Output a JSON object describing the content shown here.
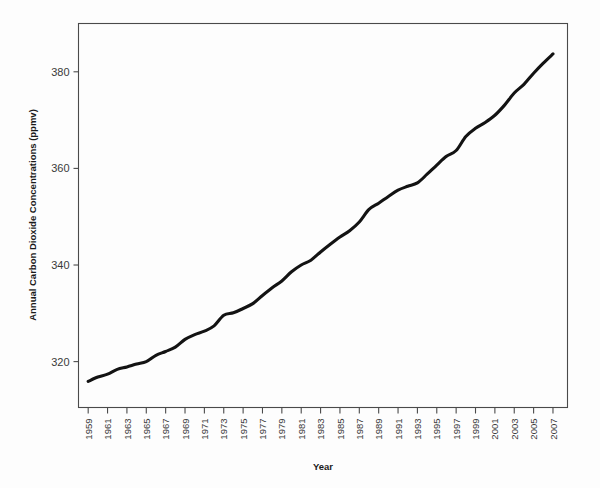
{
  "chart_data": {
    "type": "line",
    "title": "",
    "xlabel": "Year",
    "ylabel": "Annual Carbon Dioxide Concentrations (ppmv)",
    "xlim": [
      1958,
      2008.5
    ],
    "ylim": [
      310.5,
      390.0
    ],
    "grid": false,
    "legend": "none",
    "y_ticks": [
      320,
      340,
      360,
      380
    ],
    "y_tick_labels": [
      "320",
      "340",
      "360",
      "380"
    ],
    "x_tick_labels": [
      "1959",
      "1961",
      "1963",
      "1965",
      "1967",
      "1969",
      "1971",
      "1973",
      "1975",
      "1977",
      "1979",
      "1981",
      "1983",
      "1985",
      "1987",
      "1989",
      "1991",
      "1993",
      "1995",
      "1997",
      "1999",
      "2001",
      "2003",
      "2005",
      "2007"
    ],
    "x_tick_values": [
      1959,
      1961,
      1963,
      1965,
      1967,
      1969,
      1971,
      1973,
      1975,
      1977,
      1979,
      1981,
      1983,
      1985,
      1987,
      1989,
      1991,
      1993,
      1995,
      1997,
      1999,
      2001,
      2003,
      2005,
      2007
    ],
    "x_tick_label_rotation": 90,
    "series": [
      {
        "name": "Annual mean CO2",
        "color": "#131313",
        "x": [
          1959,
          1960,
          1961,
          1962,
          1963,
          1964,
          1965,
          1966,
          1967,
          1968,
          1969,
          1970,
          1971,
          1972,
          1973,
          1974,
          1975,
          1976,
          1977,
          1978,
          1979,
          1980,
          1981,
          1982,
          1983,
          1984,
          1985,
          1986,
          1987,
          1988,
          1989,
          1990,
          1991,
          1992,
          1993,
          1994,
          1995,
          1996,
          1997,
          1998,
          1999,
          2000,
          2001,
          2002,
          2003,
          2004,
          2005,
          2006,
          2007
        ],
        "values": [
          315.9,
          316.8,
          317.4,
          318.4,
          318.9,
          319.5,
          320.0,
          321.3,
          322.1,
          323.0,
          324.6,
          325.6,
          326.3,
          327.4,
          329.6,
          330.1,
          331.0,
          332.0,
          333.7,
          335.3,
          336.7,
          338.6,
          340.0,
          341.0,
          342.7,
          344.3,
          345.8,
          347.1,
          348.9,
          351.5,
          352.8,
          354.2,
          355.5,
          356.3,
          357.0,
          358.8,
          360.7,
          362.5,
          363.7,
          366.6,
          368.3,
          369.5,
          371.0,
          373.1,
          375.6,
          377.4,
          379.7,
          381.8,
          383.7
        ]
      }
    ]
  },
  "axis": {
    "y_title": "Annual Carbon Dioxide Concentrations (ppmv)",
    "x_title": "Year"
  }
}
